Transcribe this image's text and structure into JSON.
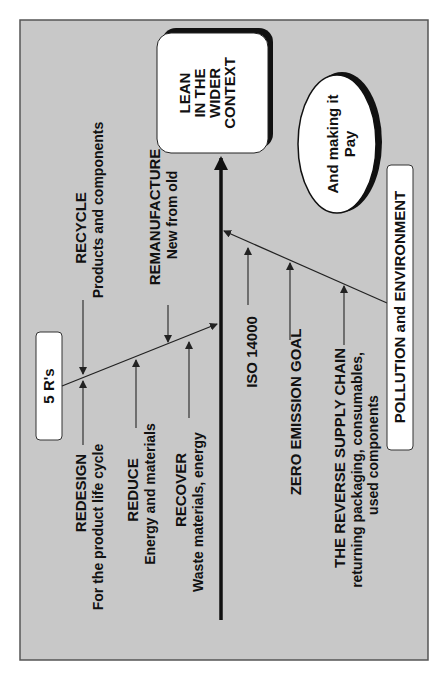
{
  "diagram": {
    "title_box": {
      "lines": [
        "LEAN",
        "IN THE",
        "WIDER",
        "CONTEXT"
      ]
    },
    "ellipse": {
      "lines": [
        "And making it",
        "Pay"
      ]
    },
    "groups": {
      "five_rs": {
        "label": "5 R's",
        "items": [
          {
            "title": "REDESIGN",
            "subtitle": "For the product life cycle"
          },
          {
            "title": "REDUCE",
            "subtitle": "Energy and materials"
          },
          {
            "title": "RECOVER",
            "subtitle": "Waste materials, energy"
          },
          {
            "title": "RECYCLE",
            "subtitle": "Products and components"
          },
          {
            "title": "REMANUFACTURE",
            "subtitle": "New from old"
          }
        ]
      },
      "pollution": {
        "label": "POLLUTION and ENVIRONMENT",
        "items": [
          {
            "title": "ISO 14000"
          },
          {
            "title": "ZERO EMISSION GOAL"
          },
          {
            "title": "THE REVERSE SUPPLY CHAIN",
            "subtitle_lines": [
              "returning packaging, consumables,",
              "used components"
            ]
          }
        ]
      }
    },
    "colors": {
      "background": "#c8c8c8",
      "frame_border": "#555555",
      "box_fill": "#ffffff",
      "shadow": "#111111",
      "line": "#222222"
    }
  }
}
